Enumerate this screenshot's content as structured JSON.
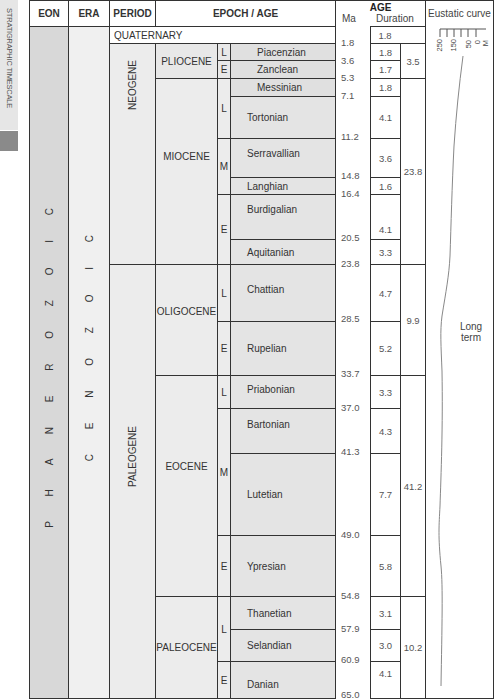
{
  "side_label": "STRATIGRAPHIC TIMESCALE",
  "headers": {
    "eon": "EON",
    "era": "ERA",
    "period": "PERIOD",
    "epoch_age": "EPOCH / AGE",
    "age": "AGE",
    "ma": "Ma",
    "duration": "Duration",
    "eustatic": "Eustatic curve"
  },
  "eon": "P H A N E R O Z O I C",
  "era": "C E N O Z O I C",
  "periods": {
    "quaternary": "QUATERNARY",
    "neogene": "NEOGENE",
    "paleogene": "PALEOGENE"
  },
  "epochs": {
    "pliocene": "PLIOCENE",
    "miocene": "MIOCENE",
    "oligocene": "OLIGOCENE",
    "eocene": "EOCENE",
    "paleocene": "PALEOCENE"
  },
  "subdivisions": [
    "L",
    "E",
    "L",
    "M",
    "E",
    "L",
    "E",
    "L",
    "M",
    "E",
    "L",
    "E"
  ],
  "ages": [
    {
      "name": "Piacenzian",
      "duration": "1.8"
    },
    {
      "name": "Zanclean",
      "duration": "1.7"
    },
    {
      "name": "Messinian",
      "duration": "1.8"
    },
    {
      "name": "Tortonian",
      "duration": "4.1"
    },
    {
      "name": "Serravallian",
      "duration": "3.6"
    },
    {
      "name": "Langhian",
      "duration": "1.6"
    },
    {
      "name": "Burdigalian",
      "duration": "4.1"
    },
    {
      "name": "Aquitanian",
      "duration": "3.3"
    },
    {
      "name": "Chattian",
      "duration": "4.7"
    },
    {
      "name": "Rupelian",
      "duration": "5.2"
    },
    {
      "name": "Priabonian",
      "duration": "3.3"
    },
    {
      "name": "Bartonian",
      "duration": "4.3"
    },
    {
      "name": "Lutetian",
      "duration": "7.7"
    },
    {
      "name": "Ypresian",
      "duration": "5.8"
    },
    {
      "name": "Thanetian",
      "duration": "3.1"
    },
    {
      "name": "Selandian",
      "duration": "3.0"
    },
    {
      "name": "Danian",
      "duration": "4.1"
    }
  ],
  "quaternary_duration": "1.8",
  "ma_values": [
    "1.8",
    "3.6",
    "5.3",
    "7.1",
    "11.2",
    "14.8",
    "16.4",
    "20.5",
    "23.8",
    "28.5",
    "33.7",
    "37.0",
    "41.3",
    "49.0",
    "54.8",
    "57.9",
    "60.9",
    "65.0"
  ],
  "epoch_durations": {
    "pliocene": "3.5",
    "miocene": "23.8",
    "oligocene": "9.9",
    "eocene": "41.2",
    "paleocene": "10.2"
  },
  "eustatic": {
    "scale_labels": [
      "250",
      "150",
      "50",
      "0",
      "M"
    ],
    "curve_label_line1": "Long",
    "curve_label_line2": "term"
  }
}
